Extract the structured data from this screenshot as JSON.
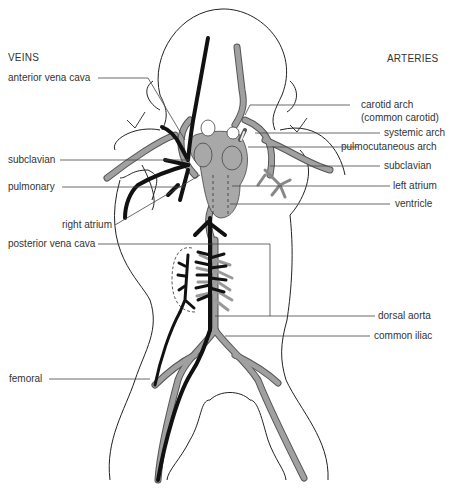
{
  "headers": {
    "veins": "VEINS",
    "arteries": "ARTERIES"
  },
  "vein_labels": [
    {
      "id": "anterior-vena-cava",
      "text": "anterior vena cava"
    },
    {
      "id": "subclavian-vein",
      "text": "subclavian"
    },
    {
      "id": "pulmonary",
      "text": "pulmonary"
    },
    {
      "id": "right-atrium",
      "text": "right atrium"
    },
    {
      "id": "posterior-vena-cava",
      "text": "posterior vena cava"
    },
    {
      "id": "femoral",
      "text": "femoral"
    }
  ],
  "artery_labels": [
    {
      "id": "carotid-arch",
      "text": "carotid arch",
      "text2": "(common carotid)"
    },
    {
      "id": "systemic-arch",
      "text": "systemic arch"
    },
    {
      "id": "pulmocutaneous-arch",
      "text": "pulmocutaneous arch"
    },
    {
      "id": "subclavian-artery",
      "text": "subclavian"
    },
    {
      "id": "left-atrium",
      "text": "left atrium"
    },
    {
      "id": "ventricle",
      "text": "ventricle"
    },
    {
      "id": "dorsal-aorta",
      "text": "dorsal aorta"
    },
    {
      "id": "common-iliac",
      "text": "common iliac"
    }
  ],
  "colors": {
    "vein": "#111111",
    "artery": "#9a9a9a",
    "artery_outline": "#555555",
    "outline": "#222222",
    "leader": "#444444",
    "heart": "#a8a8a8"
  }
}
